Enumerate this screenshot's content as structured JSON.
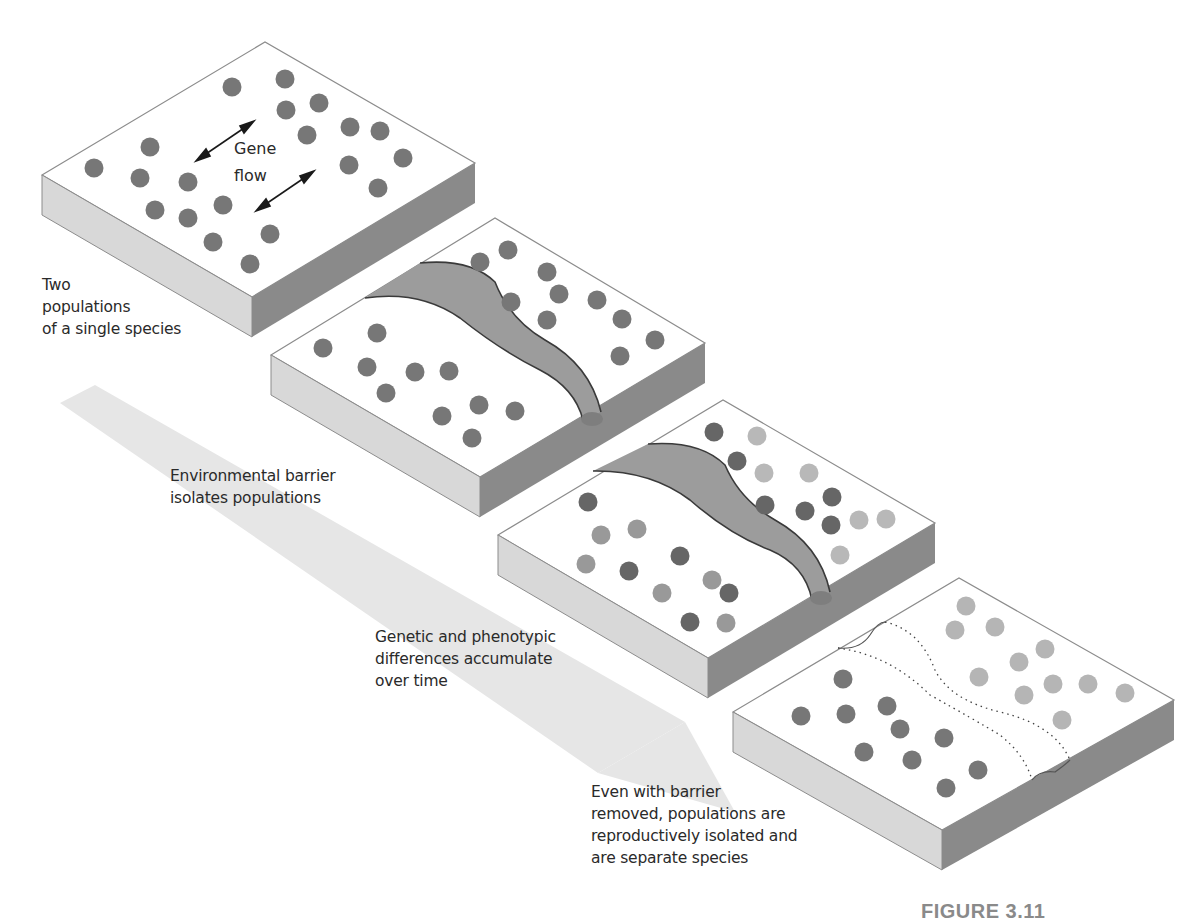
{
  "figure": {
    "label": "FIGURE 3.11",
    "colors": {
      "slab_top": "#ffffff",
      "slab_left_side": "#d6d6d6",
      "slab_right_side": "#8a8a8a",
      "slab_edge": "#8c8c8c",
      "barrier_fill": "#9a9a9a",
      "barrier_line": "#3a3a3a",
      "dot_dark": "#777777",
      "dot_darker": "#666666",
      "dot_medium": "#9a9a9a",
      "dot_light": "#b8b8b8",
      "time_arrow": "#e3e3e3",
      "text": "#2a2a2a",
      "figure_label": "#8a8a8a"
    }
  },
  "stages": [
    {
      "id": 1,
      "caption_lines": [
        "Two",
        "populations",
        "of a single species"
      ],
      "inline_label_lines": [
        "Gene",
        "flow"
      ]
    },
    {
      "id": 2,
      "caption_lines": [
        "Environmental barrier",
        "isolates populations"
      ]
    },
    {
      "id": 3,
      "caption_lines": [
        "Genetic and phenotypic",
        "differences accumulate",
        "over time"
      ]
    },
    {
      "id": 4,
      "caption_lines": [
        "Even with barrier",
        "removed, populations are",
        "reproductively isolated and",
        "are separate species"
      ]
    }
  ],
  "icons": {
    "gene_flow_arrow": "double-headed-arrow",
    "time_arrow": "large-faint-down-right-arrow"
  }
}
